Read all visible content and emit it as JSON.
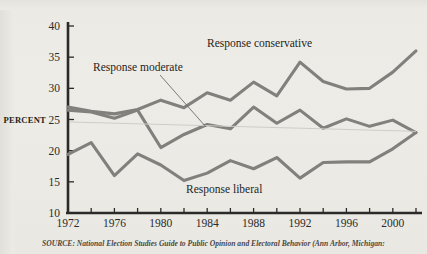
{
  "figure": {
    "y_axis_title": "PERCENT",
    "source_note": "SOURCE: National Election Studies Guide to Public Opinion and Electoral Behavior (Ann Arbor, Michigan:"
  },
  "chart_data": {
    "type": "line",
    "title": "",
    "xlabel": "",
    "ylabel": "PERCENT",
    "xlim": [
      1972,
      2002
    ],
    "ylim": [
      10,
      40
    ],
    "yticks": [
      10,
      15,
      20,
      25,
      30,
      35,
      40
    ],
    "xticks": [
      1972,
      1974,
      1976,
      1978,
      1980,
      1982,
      1984,
      1986,
      1988,
      1990,
      1992,
      1994,
      1996,
      1998,
      2000,
      2002
    ],
    "xtick_labels_shown": [
      "1972",
      "1976",
      "1980",
      "1984",
      "1988",
      "1992",
      "1996",
      "2000"
    ],
    "grid": false,
    "legend": "inline-annotations",
    "x": [
      1972,
      1974,
      1976,
      1978,
      1980,
      1982,
      1984,
      1986,
      1988,
      1990,
      1992,
      1994,
      1996,
      1998,
      2000,
      2002
    ],
    "series": [
      {
        "name": "Response conservative",
        "color": "#82807c",
        "values": [
          27.0,
          26.3,
          25.9,
          26.6,
          28.1,
          26.9,
          29.3,
          28.1,
          31.0,
          28.8,
          34.2,
          31.1,
          29.9,
          30.0,
          32.6,
          36.0
        ]
      },
      {
        "name": "Response moderate",
        "color": "#82807c",
        "values": [
          26.5,
          26.2,
          25.2,
          26.5,
          20.5,
          22.6,
          24.2,
          23.5,
          27.0,
          24.4,
          26.5,
          23.6,
          25.1,
          23.9,
          24.9,
          22.9
        ]
      },
      {
        "name": "Response liberal",
        "color": "#82807c",
        "values": [
          19.4,
          21.3,
          16.0,
          19.5,
          17.7,
          15.2,
          16.4,
          18.4,
          17.1,
          18.9,
          15.6,
          18.1,
          18.2,
          18.2,
          20.3,
          22.9
        ]
      }
    ],
    "annotations": [
      {
        "text": "Response conservative",
        "x_px": 207,
        "y_px": 47
      },
      {
        "text": "Response moderate",
        "x_px": 93,
        "y_px": 71
      },
      {
        "text": "Response liberal",
        "x_px": 186,
        "y_px": 193
      }
    ]
  }
}
